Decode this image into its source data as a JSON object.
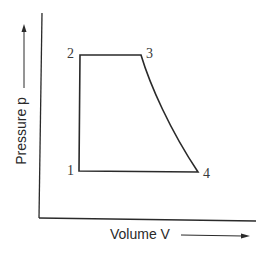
{
  "diagram": {
    "title": "",
    "axes": {
      "x_label": "Volume V",
      "y_label": "Pressure p"
    },
    "points": [
      {
        "id": "1",
        "label": "1"
      },
      {
        "id": "2",
        "label": "2"
      },
      {
        "id": "3",
        "label": "3"
      },
      {
        "id": "4",
        "label": "4"
      }
    ],
    "processes": [
      {
        "from": "1",
        "to": "2",
        "shape": "vertical line"
      },
      {
        "from": "2",
        "to": "3",
        "shape": "horizontal line"
      },
      {
        "from": "3",
        "to": "4",
        "shape": "curve"
      },
      {
        "from": "4",
        "to": "1",
        "shape": "horizontal line"
      }
    ],
    "colors": {
      "line": "#2a2a2a",
      "background": "#ffffff"
    }
  }
}
